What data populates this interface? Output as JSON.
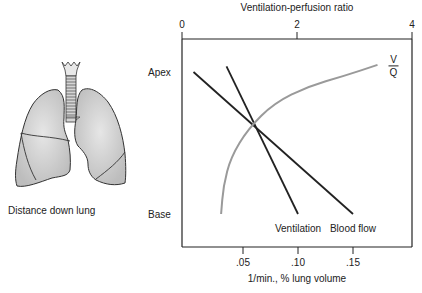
{
  "chart_data": {
    "type": "line",
    "title": "",
    "top_axis": {
      "label": "Ventilation-perfusion ratio",
      "range": [
        0,
        4
      ],
      "ticks": [
        {
          "value": 0,
          "label": "0"
        },
        {
          "value": 2,
          "label": "2"
        },
        {
          "value": 4,
          "label": "4"
        }
      ]
    },
    "bottom_axis": {
      "label": "1/min., % lung volume",
      "range": [
        0,
        0.2
      ],
      "ticks": [
        {
          "value": 0.05,
          "label": ".05"
        },
        {
          "value": 0.1,
          "label": ".10"
        },
        {
          "value": 0.15,
          "label": ".15"
        }
      ]
    },
    "left_axis": {
      "label": "Distance down lung",
      "categories": [
        {
          "position": 0,
          "label": "Apex"
        },
        {
          "position": 1,
          "label": "Base"
        }
      ]
    },
    "series": [
      {
        "name": "Blood flow",
        "axis": "bottom",
        "color": "#222222",
        "points": [
          {
            "x": 0.005,
            "y": 0
          },
          {
            "x": 0.15,
            "y": 1
          }
        ]
      },
      {
        "name": "Ventilation",
        "axis": "bottom",
        "color": "#222222",
        "points": [
          {
            "x": 0.035,
            "y": -0.04
          },
          {
            "x": 0.1,
            "y": 1
          }
        ]
      },
      {
        "name": "V/Q",
        "label_num": "V",
        "label_den": "Q",
        "axis": "top",
        "color": "#9a9a9a",
        "points": [
          {
            "x": 0.68,
            "y": 1.0
          },
          {
            "x": 0.72,
            "y": 0.8
          },
          {
            "x": 0.85,
            "y": 0.6
          },
          {
            "x": 1.15,
            "y": 0.4
          },
          {
            "x": 1.6,
            "y": 0.22
          },
          {
            "x": 2.2,
            "y": 0.1
          },
          {
            "x": 2.8,
            "y": 0.03
          },
          {
            "x": 3.4,
            "y": -0.05
          }
        ]
      }
    ],
    "grid": false,
    "legend": "inline labels at line ends"
  },
  "illustration": {
    "name": "lungs",
    "fill": "#cfcfcf",
    "stroke": "#333333"
  }
}
